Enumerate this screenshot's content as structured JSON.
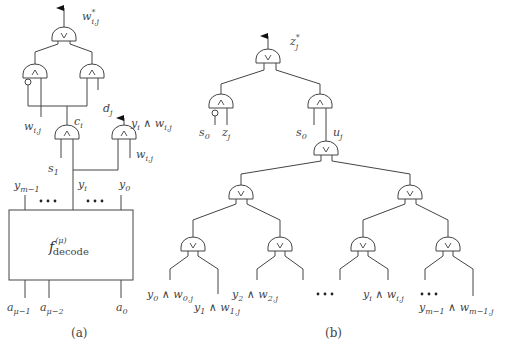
{
  "figure": {
    "panel_a": {
      "caption": "(a)",
      "outputs": {
        "top": {
          "base": "w",
          "sup": "*",
          "sub": "i,j"
        },
        "side": {
          "text": "y",
          "sub": "i",
          "tail": " ∧ w",
          "tail_sub": "i,j"
        }
      },
      "labels": {
        "w_ij_left": {
          "base": "w",
          "sub": "i,j"
        },
        "c_i": {
          "base": "c",
          "sub": "i"
        },
        "d_j": {
          "base": "d",
          "sub": "j"
        },
        "s_1": {
          "base": "s",
          "sub": "1"
        },
        "y_i": {
          "base": "y",
          "sub": "i"
        },
        "w_ij_right": {
          "base": "w",
          "sub": "i,j"
        },
        "y_m1": {
          "base": "y",
          "sub": "m−1"
        },
        "y_0": {
          "base": "y",
          "sub": "0"
        },
        "a_mu1": {
          "base": "a",
          "sub": "μ−1"
        },
        "a_mu2": {
          "base": "a",
          "sub": "μ−2"
        },
        "a_0": {
          "base": "a",
          "sub": "0"
        }
      },
      "decoder": {
        "base": "f",
        "sup": "(μ)",
        "sub": "decode"
      },
      "gates": [
        {
          "id": "or_top",
          "type": "OR",
          "symbol": "∨"
        },
        {
          "id": "and_left",
          "type": "AND",
          "symbol": "∧",
          "negated_input": true
        },
        {
          "id": "and_right",
          "type": "AND",
          "symbol": "∧"
        },
        {
          "id": "and_ci",
          "type": "AND",
          "symbol": "∧"
        },
        {
          "id": "and_out",
          "type": "AND",
          "symbol": "∧"
        }
      ]
    },
    "panel_b": {
      "caption": "(b)",
      "output": {
        "base": "z",
        "sup": "*",
        "sub": "j"
      },
      "labels": {
        "s0_left": {
          "base": "s",
          "sub": "0"
        },
        "z_j": {
          "base": "z",
          "sub": "j"
        },
        "s0_right": {
          "base": "s",
          "sub": "0"
        },
        "u_j": {
          "base": "u",
          "sub": "j"
        }
      },
      "leaf_labels": [
        {
          "y": "y",
          "ysub": "0",
          "w": "w",
          "wsub": "0,j"
        },
        {
          "y": "y",
          "ysub": "1",
          "w": "w",
          "wsub": "1,j"
        },
        {
          "y": "y",
          "ysub": "2",
          "w": "w",
          "wsub": "2,j"
        },
        {
          "y": "y",
          "ysub": "i",
          "w": "w",
          "wsub": "i,j"
        },
        {
          "y": "y",
          "ysub": "m−1",
          "w": "w",
          "wsub": "m−1,j"
        }
      ],
      "and_symbol": "∧",
      "or_symbol": "∨",
      "gates": [
        {
          "id": "or_top",
          "type": "OR"
        },
        {
          "id": "and_left",
          "type": "AND",
          "negated_input": true
        },
        {
          "id": "and_right",
          "type": "AND"
        },
        {
          "id": "or_tree_root",
          "type": "OR"
        },
        {
          "id": "or_l1_left",
          "type": "OR"
        },
        {
          "id": "or_l1_right",
          "type": "OR"
        },
        {
          "id": "or_l2_1",
          "type": "OR"
        },
        {
          "id": "or_l2_2",
          "type": "OR"
        },
        {
          "id": "or_l2_3",
          "type": "OR"
        },
        {
          "id": "or_l2_4",
          "type": "OR"
        }
      ]
    }
  }
}
